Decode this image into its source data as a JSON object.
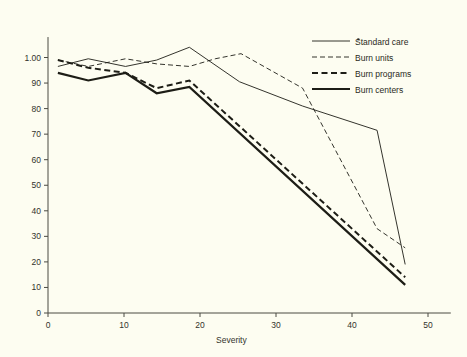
{
  "chart_data": {
    "type": "line",
    "title": "",
    "subtitle": "",
    "xlabel": "Severity",
    "ylabel": "",
    "xlim": [
      0,
      53
    ],
    "ylim": [
      0,
      108
    ],
    "grid": false,
    "legend_position": "top-right",
    "xticks": [
      0,
      10,
      20,
      30,
      40,
      50
    ],
    "xticklabels": [
      "0",
      "10",
      "20",
      "30",
      "40",
      "50"
    ],
    "yticks": [
      0,
      10,
      20,
      30,
      40,
      50,
      60,
      70,
      80,
      90,
      100
    ],
    "yticklabels": [
      "0",
      "10",
      "20",
      "30",
      "40",
      "50",
      "60",
      "70",
      "80",
      "90",
      "1.00"
    ],
    "series": [
      {
        "name": "Standard care",
        "style": "solid-thin",
        "stroke_width": 0.9,
        "dash": "none",
        "x": [
          1.3,
          5.3,
          10.2,
          14.3,
          18.6,
          25.2,
          33.5,
          43.3,
          47.0
        ],
        "y": [
          96.5,
          99.5,
          96.5,
          99.0,
          104.0,
          90.5,
          81.0,
          71.5,
          19.0
        ],
        "points": [
          {
            "x": 1.3,
            "y": 96.5
          },
          {
            "x": 5.3,
            "y": 99.5
          },
          {
            "x": 10.2,
            "y": 96.5
          },
          {
            "x": 14.3,
            "y": 99.0
          },
          {
            "x": 18.6,
            "y": 104.0
          },
          {
            "x": 25.2,
            "y": 81.0
          },
          {
            "x": 33.5,
            "y": 71.5
          },
          {
            "x": 47.0,
            "y": 19.0
          }
        ]
      },
      {
        "name": "Burn units",
        "style": "dashed-thin",
        "stroke_width": 0.9,
        "dash": "5,3",
        "x": [
          1.3,
          5.3,
          10.2,
          14.3,
          18.6,
          22.0,
          25.4,
          33.5,
          43.3,
          47.0
        ],
        "y": [
          99.0,
          96.5,
          99.5,
          97.5,
          96.5,
          99.5,
          101.5,
          88.0,
          33.0,
          25.5
        ],
        "points": [
          {
            "x": 1.3,
            "y": 99.0
          },
          {
            "x": 5.3,
            "y": 96.5
          },
          {
            "x": 10.2,
            "y": 99.5
          },
          {
            "x": 14.3,
            "y": 97.5
          },
          {
            "x": 18.6,
            "y": 96.5
          },
          {
            "x": 25.4,
            "y": 101.5
          },
          {
            "x": 33.5,
            "y": 88.0
          },
          {
            "x": 47.0,
            "y": 25.5
          }
        ]
      },
      {
        "name": "Burn programs",
        "style": "dashed-thick",
        "stroke_width": 2.0,
        "dash": "6,3.5",
        "x": [
          1.3,
          5.3,
          10.2,
          14.3,
          18.6,
          47.0
        ],
        "y": [
          99.0,
          96.0,
          94.0,
          88.0,
          91.0,
          14.0
        ],
        "points": [
          {
            "x": 1.3,
            "y": 99.0
          },
          {
            "x": 5.3,
            "y": 96.0
          },
          {
            "x": 10.2,
            "y": 94.0
          },
          {
            "x": 14.3,
            "y": 88.0
          },
          {
            "x": 18.6,
            "y": 91.0
          },
          {
            "x": 47.0,
            "y": 14.0
          }
        ]
      },
      {
        "name": "Burn centers",
        "style": "solid-thick",
        "stroke_width": 2.2,
        "dash": "none",
        "x": [
          1.3,
          5.3,
          10.2,
          14.3,
          18.6,
          47.0
        ],
        "y": [
          94.0,
          91.0,
          94.0,
          86.0,
          88.5,
          11.0
        ],
        "points": [
          {
            "x": 1.3,
            "y": 94.0
          },
          {
            "x": 5.3,
            "y": 91.0
          },
          {
            "x": 10.2,
            "y": 94.0
          },
          {
            "x": 14.3,
            "y": 86.0
          },
          {
            "x": 18.6,
            "y": 88.5
          },
          {
            "x": 47.0,
            "y": 11.0
          }
        ]
      }
    ],
    "annotations": [
      {
        "name": "stray-dot",
        "x": 40.7,
        "y": 107.5
      }
    ]
  },
  "legend": {
    "entries": [
      {
        "label": "Standard care"
      },
      {
        "label": "Burn units"
      },
      {
        "label": "Burn programs"
      },
      {
        "label": "Burn centers"
      }
    ]
  },
  "axes": {
    "x_title": "Severity",
    "y_title": ""
  },
  "colors": {
    "background": "#fdfdf1",
    "ink": "#1d1d16",
    "axis": "#4a4a42",
    "text": "#33332c"
  }
}
